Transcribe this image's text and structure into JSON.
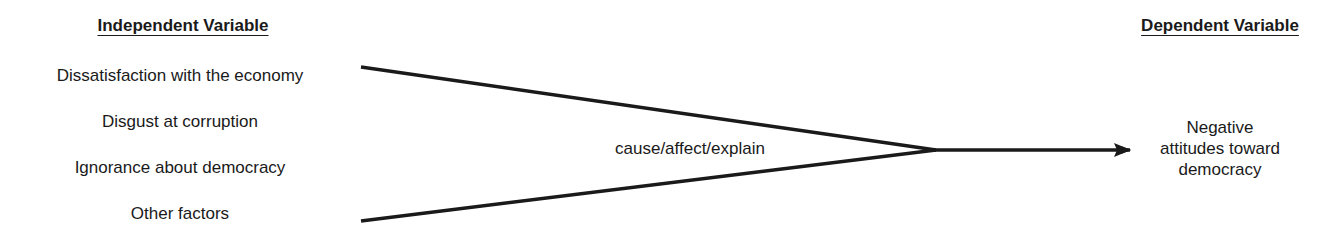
{
  "independent": {
    "heading": "Independent Variable",
    "items": [
      "Dissatisfaction with the economy",
      "Disgust at corruption",
      "Ignorance about democracy",
      "Other factors"
    ]
  },
  "relation": {
    "label": "cause/affect/explain"
  },
  "dependent": {
    "heading": "Dependent Variable",
    "lines": [
      "Negative",
      "attitudes toward",
      "democracy"
    ]
  },
  "colors": {
    "ink": "#1a1a1a",
    "background": "#ffffff"
  }
}
